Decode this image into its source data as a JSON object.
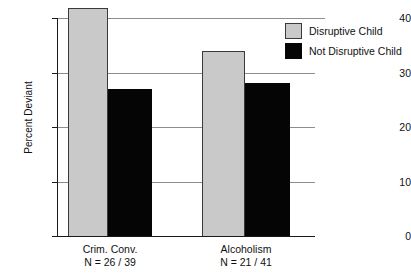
{
  "chart_data": {
    "type": "bar",
    "title": "",
    "subtitle": "",
    "xlabel": "",
    "ylabel": "Percent Deviant",
    "ylim": [
      0,
      40
    ],
    "yticks": [
      0,
      10,
      20,
      30,
      40
    ],
    "ytick_labels": [
      "0",
      "10",
      "20",
      "30",
      "40"
    ],
    "grid": "horizontal",
    "legend_position": "top-right",
    "categories": [
      "Crim. Conv.",
      "Alcoholism"
    ],
    "category_sublabels": [
      "N = 26 / 39",
      "N = 21 / 41"
    ],
    "series": [
      {
        "name": "Disruptive Child",
        "color": "#c9c9c9",
        "values": [
          41.8,
          34.0
        ]
      },
      {
        "name": "Not Disruptive Child",
        "color": "#050505",
        "values": [
          27.0,
          28.0
        ]
      }
    ]
  },
  "axes": {
    "y_title": "Percent Deviant",
    "y_ticks": [
      {
        "label": "40",
        "value": 40
      },
      {
        "label": "30",
        "value": 30
      },
      {
        "label": "20",
        "value": 20
      },
      {
        "label": "10",
        "value": 10
      },
      {
        "label": "0",
        "value": 0
      }
    ],
    "x_groups": [
      {
        "label": "Crim. Conv.",
        "n_label": "N = 26 / 39"
      },
      {
        "label": "Alcoholism",
        "n_label": "N = 21 / 41"
      }
    ]
  },
  "legend": {
    "items": [
      {
        "label": "Disruptive Child",
        "swatch": "gray-swatch-icon"
      },
      {
        "label": "Not Disruptive Child",
        "swatch": "black-swatch-icon"
      }
    ]
  },
  "colors": {
    "disruptive": "#c9c9c9",
    "not_disruptive": "#050505",
    "axis": "#1a1a1a",
    "gridline": "#8d8d8d",
    "background": "#ffffff"
  }
}
